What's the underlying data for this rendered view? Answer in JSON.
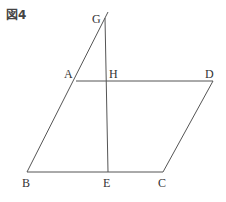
{
  "figure": {
    "title": "図4"
  },
  "points": {
    "G": {
      "label": "G",
      "x": 108,
      "y": 12
    },
    "A": {
      "label": "A",
      "x": 76,
      "y": 81
    },
    "H": {
      "label": "H",
      "x": 107,
      "y": 81
    },
    "D": {
      "label": "D",
      "x": 213,
      "y": 81
    },
    "B": {
      "label": "B",
      "x": 27,
      "y": 172
    },
    "E": {
      "label": "E",
      "x": 108,
      "y": 172
    },
    "C": {
      "label": "C",
      "x": 163,
      "y": 172
    }
  },
  "segments": [
    [
      "G",
      "B"
    ],
    [
      "G",
      "E"
    ],
    [
      "A",
      "D"
    ],
    [
      "D",
      "C"
    ],
    [
      "B",
      "C"
    ]
  ],
  "colors": {
    "line": "#555555",
    "text": "#333333"
  }
}
